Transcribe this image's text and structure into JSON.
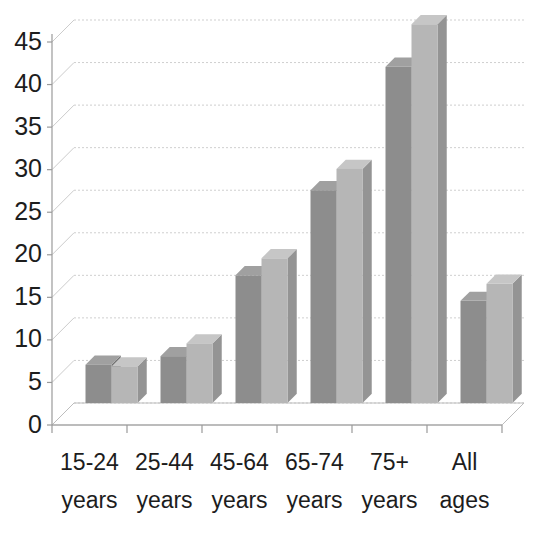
{
  "chart_data": {
    "type": "bar",
    "title": "",
    "subtitle": "",
    "xlabel": "",
    "ylabel": "",
    "categories": [
      "15-24 years",
      "25-44 years",
      "45-64 years",
      "65-74 years",
      "75+ years",
      "All ages"
    ],
    "category_lines": [
      [
        "15-24",
        "years"
      ],
      [
        "25-44",
        "years"
      ],
      [
        "45-64",
        "years"
      ],
      [
        "65-74",
        "years"
      ],
      [
        "75+",
        "years"
      ],
      [
        "All",
        "ages"
      ]
    ],
    "series": [
      {
        "name": "Series 1",
        "color": "#8d8d8d",
        "values": [
          4.5,
          5.5,
          15.0,
          25.0,
          39.5,
          12.0
        ]
      },
      {
        "name": "Series 2",
        "color": "#b6b6b6",
        "values": [
          4.3,
          7.0,
          17.0,
          27.5,
          44.5,
          14.0
        ]
      }
    ],
    "ylim": [
      0,
      45
    ],
    "ytick_values": [
      0,
      5,
      10,
      15,
      20,
      25,
      30,
      35,
      40,
      45
    ],
    "ytick_labels": [
      "0",
      "5",
      "10",
      "15",
      "20",
      "25",
      "30",
      "35",
      "40",
      "45"
    ],
    "grid": true,
    "grid_axis": "y",
    "legend": "none",
    "style": "3d-clustered-column",
    "colors": {
      "series1_front": "#8d8d8d",
      "series1_side": "#6f6f6f",
      "series1_top": "#a0a0a0",
      "series2_front": "#b6b6b6",
      "series2_side": "#949494",
      "series2_top": "#c6c6c6",
      "gridline": "#cfcfcf",
      "axis": "#9a9a9a",
      "text": "#1d1d1d",
      "background": "#ffffff"
    }
  },
  "axes": {
    "y_axis_name": "value-axis",
    "x_axis_name": "category-axis"
  }
}
